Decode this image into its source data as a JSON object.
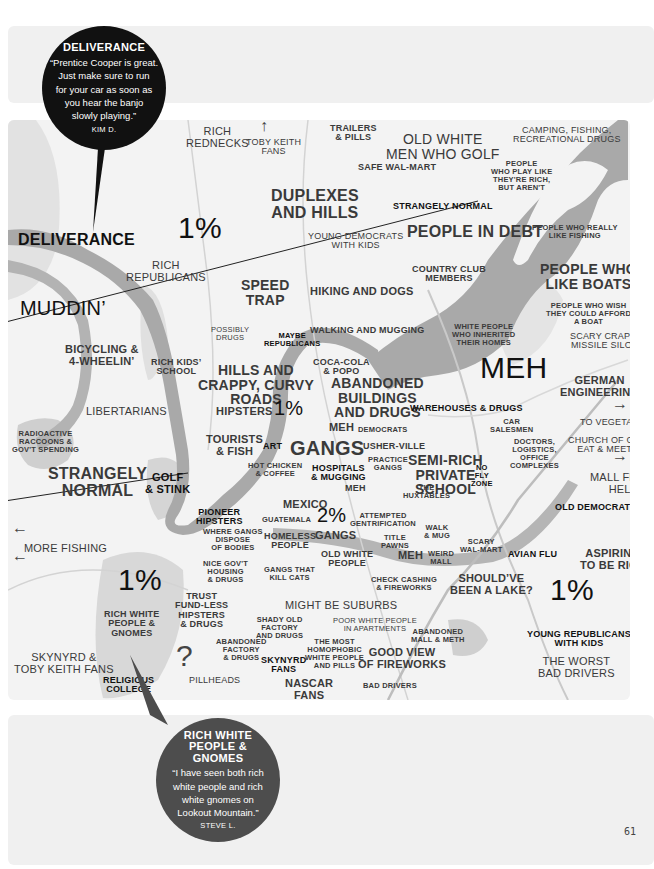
{
  "page_number": "61",
  "callouts": [
    {
      "title": "DELIVERANCE",
      "quote": "“Prentice Cooper is great. Just make sure to run for your car as soon as you hear the banjo slowly playing.”",
      "quote_lines": [
        "“Prentice Cooper is great.",
        "Just make sure to run",
        "for your car as soon as",
        "you hear the banjo",
        "slowly playing.”"
      ],
      "author": "KIM D."
    },
    {
      "title": "RICH WHITE PEOPLE & GNOMES",
      "title_lines": [
        "RICH WHITE",
        "PEOPLE &",
        "GNOMES"
      ],
      "quote_lines": [
        "“I have seen both rich",
        "white people and rich",
        "white gnomes on",
        "Lookout Mountain.”"
      ],
      "author": "STEVE L."
    }
  ],
  "colors": {
    "map_background": "#f3f3f3",
    "river": "#a9a9a9",
    "panel": "#f0f0f0",
    "callout_dark": "#111111",
    "callout_gray": "#4d4d4d"
  },
  "labels": {
    "rich_rednecks": [
      "RICH",
      "REDNECKS"
    ],
    "toby_keith_fans_arrow": "↑",
    "toby_keith_fans": [
      "TOBY KEITH",
      "FANS"
    ],
    "trailers_pills": [
      "TRAILERS",
      "& PILLS"
    ],
    "old_white_men_golf": [
      "OLD WHITE",
      "MEN WHO GOLF"
    ],
    "camping_fishing": [
      "CAMPING, FISHING,",
      "RECREATIONAL DRUGS"
    ],
    "people_play_rich": [
      "PEOPLE",
      "WHO PLAY LIKE",
      "THEY'RE RICH,",
      "BUT AREN'T"
    ],
    "safe_walmart": "SAFE WAL-MART",
    "duplexes_hills": [
      "DUPLEXES",
      "AND HILLS"
    ],
    "strangely_normal_top": "STRANGELY NORMAL",
    "deliverance": "DELIVERANCE",
    "one_pct_a": "1%",
    "young_democrats": [
      "YOUNG DEMOCRATS",
      "WITH KIDS"
    ],
    "people_in_debt": "PEOPLE IN DEBT",
    "people_really_fishing": [
      "PEOPLE WHO REALLY",
      "LIKE FISHING"
    ],
    "rich_republicans": [
      "RICH",
      "REPUBLICANS"
    ],
    "country_club": [
      "COUNTRY CLUB",
      "MEMBERS"
    ],
    "people_like_boats": [
      "PEOPLE WHO",
      "LIKE BOATS"
    ],
    "speed_trap": [
      "SPEED",
      "TRAP"
    ],
    "hiking_dogs": "HIKING AND DOGS",
    "muddin": "MUDDIN’",
    "people_wish_boat": [
      "PEOPLE WHO WISH",
      "THEY COULD AFFORD",
      "A BOAT"
    ],
    "possibly_drugs": [
      "POSSIBLY",
      "DRUGS"
    ],
    "maybe_republicans": [
      "MAYBE",
      "REPUBLICANS"
    ],
    "walking_mugging": "WALKING AND MUGGING",
    "white_people_inherited": [
      "WHITE PEOPLE",
      "WHO INHERITED",
      "THEIR HOMES"
    ],
    "scary_crap": [
      "SCARY CRAP &",
      "MISSILE SILOS"
    ],
    "bicycling": [
      "BICYCLING &",
      "4-WHEELIN’"
    ],
    "rich_kids_school": [
      "RICH KIDS’",
      "SCHOOL"
    ],
    "hills_crappy": [
      "HILLS AND",
      "CRAPPY, CURVY",
      "ROADS"
    ],
    "coca_cola": [
      "COCA-COLA",
      "& POPO"
    ],
    "meh_big": "MEH",
    "german_engineering": [
      "GERMAN",
      "ENGINEERING"
    ],
    "abandoned_buildings": [
      "ABANDONED",
      "BUILDINGS",
      "AND DRUGS"
    ],
    "libertarians": "LIBERTARIANS",
    "hipsters": "HIPSTERS",
    "one_pct_b": "1%",
    "warehouses_drugs": "WAREHOUSES & DRUGS",
    "arrow_right_1": "→",
    "to_vegetarians": "TO VEGETARIANS",
    "meh_democrats_meh": "MEH",
    "democrats": "DEMOCRATS",
    "car_salesmen": [
      "CAR",
      "SALESMEN"
    ],
    "radioactive": [
      "RADIOACTIVE",
      "RACCOONS &",
      "GOV'T SPENDING"
    ],
    "tourists_fish": [
      "TOURISTS",
      "& FISH"
    ],
    "art": "ART",
    "gangs_big": "GANGS",
    "usher_ville": "USHER-VILLE",
    "doctors": [
      "DOCTORS,",
      "LOGISTICS,",
      "OFFICE",
      "COMPLEXES"
    ],
    "church_of_god": [
      "CHURCH OF GOD",
      "EAT & MEETS"
    ],
    "arrow_right_2": "→",
    "hot_chicken": [
      "HOT CHICKEN",
      "& COFFEE"
    ],
    "hospitals_mugging": [
      "HOSPITALS",
      "& MUGGING"
    ],
    "practice_gangs": [
      "PRACTICE",
      "GANGS"
    ],
    "semi_rich": [
      "SEMI-RICH",
      "PRIVATE",
      "SCHOOL"
    ],
    "no_fly_zone": [
      "NO",
      "FLY",
      "ZONE"
    ],
    "strangely_normal_left": [
      "STRANGELY",
      "NORMAL"
    ],
    "golf_stink": [
      "GOLF",
      "& STINK"
    ],
    "mall_from_hell": [
      "MALL FROM",
      "HELL"
    ],
    "meh_small": "MEH",
    "the_huxtables": [
      "THE",
      "HUXTABLES"
    ],
    "mexico": "MEXICO",
    "old_democrats": "OLD DEMOCRATS",
    "pioneer_hipsters": [
      "PIONEER",
      "HIPSTERS"
    ],
    "guatemala": "GUATEMALA",
    "two_pct": "2%",
    "attempted_gentrification": [
      "ATTEMPTED",
      "GENTRIFICATION"
    ],
    "arrow_left_1": "←",
    "where_gangs_dispose": [
      "WHERE GANGS",
      "DISPOSE",
      "OF BODIES"
    ],
    "homeless_people": [
      "HOMELESS",
      "PEOPLE"
    ],
    "gangs_small": "GANGS",
    "title_pawns": [
      "TITLE",
      "PAWNS"
    ],
    "walk_mug": [
      "WALK",
      "& MUG"
    ],
    "more_fishing": "MORE FISHING",
    "arrow_left_2": "←",
    "scary_walmart": [
      "SCARY",
      "WAL-MART"
    ],
    "avian_flu": "AVIAN FLU",
    "aspiring_rich": [
      "ASPIRING",
      "TO BE RICH"
    ],
    "nice_govt_housing": [
      "NICE GOV'T",
      "HOUSING",
      "& DRUGS"
    ],
    "old_white_people": [
      "OLD WHITE",
      "PEOPLE"
    ],
    "meh_weird": "MEH",
    "weird_mall": [
      "WEIRD",
      "MALL"
    ],
    "one_pct_c": "1%",
    "gangs_kill_cats": [
      "GANGS THAT",
      "KILL CATS"
    ],
    "check_cashing": [
      "CHECK CASHING",
      "& FIREWORKS"
    ],
    "shouldve_lake": [
      "SHOULD’VE",
      "BEEN A LAKE?"
    ],
    "one_pct_d": "1%",
    "trust_fund": [
      "TRUST",
      "FUND-LESS",
      "HIPSTERS",
      "& DRUGS"
    ],
    "might_be_suburbs": "MIGHT BE SUBURBS",
    "shady_old_factory": [
      "SHADY OLD",
      "FACTORY",
      "AND DRUGS"
    ],
    "poor_white_people": [
      "POOR WHITE PEOPLE",
      "IN APARTMENTS"
    ],
    "rich_white_gnomes": [
      "RICH WHITE",
      "PEOPLE &",
      "GNOMES"
    ],
    "abandoned_mall_meth": [
      "ABANDONED",
      "MALL & METH"
    ],
    "young_republicans": [
      "YOUNG REPUBLICANS",
      "WITH KIDS"
    ],
    "abandoned_factory": [
      "ABANDONED",
      "FACTORY",
      "& DRUGS"
    ],
    "the_most_homophobic": [
      "THE MOST",
      "HOMOPHOBIC",
      "WHITE PEOPLE",
      "AND PILLS"
    ],
    "question_mark": "?",
    "good_view_fireworks": [
      "GOOD VIEW",
      "OF FIREWORKS"
    ],
    "skynyrd_toby": [
      "SKYNYRD &",
      "TOBY KEITH FANS"
    ],
    "skynyrd_fans": [
      "SKYNYRD",
      "FANS"
    ],
    "the_worst_drivers": [
      "THE WORST",
      "BAD DRIVERS"
    ],
    "religious_college": [
      "RELIGIOUS",
      "COLLEGE"
    ],
    "pillheads": "PILLHEADS",
    "nascar_fans": [
      "NASCAR",
      "FANS"
    ],
    "bad_drivers": "BAD DRIVERS"
  }
}
